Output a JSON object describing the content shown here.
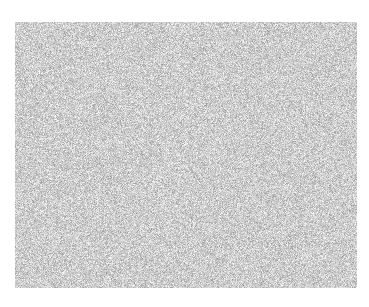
{
  "canvas": {
    "width": 369,
    "height": 307,
    "background": "#ffffff"
  },
  "noise_panel": {
    "x": 15,
    "y": 22,
    "width": 342,
    "height": 266,
    "type": "grayscale-random-noise",
    "min_gray": 150,
    "max_gray": 250,
    "mean_gray": 205,
    "seed": 1337
  }
}
